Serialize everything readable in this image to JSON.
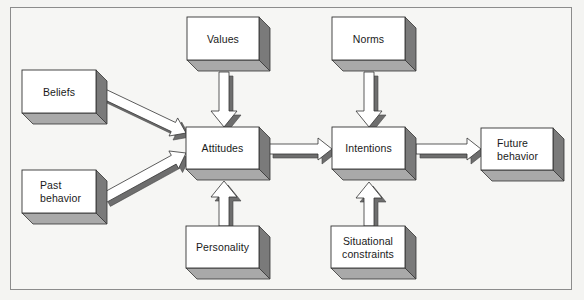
{
  "diagram": {
    "title": "",
    "nodes": [
      {
        "id": "values",
        "label": [
          "Values"
        ]
      },
      {
        "id": "norms",
        "label": [
          "Norms"
        ]
      },
      {
        "id": "beliefs",
        "label": [
          "Beliefs"
        ]
      },
      {
        "id": "attitudes",
        "label": [
          "Attitudes"
        ]
      },
      {
        "id": "intentions",
        "label": [
          "Intentions"
        ]
      },
      {
        "id": "future-behavior",
        "label": [
          "Future",
          "behavior"
        ]
      },
      {
        "id": "past-behavior",
        "label": [
          "Past",
          "behavior"
        ]
      },
      {
        "id": "personality",
        "label": [
          "Personality"
        ]
      },
      {
        "id": "situational-constraints",
        "label": [
          "Situational",
          "constraints"
        ]
      }
    ],
    "edges": [
      {
        "from": "beliefs",
        "to": "attitudes"
      },
      {
        "from": "past-behavior",
        "to": "attitudes"
      },
      {
        "from": "values",
        "to": "attitudes"
      },
      {
        "from": "personality",
        "to": "attitudes"
      },
      {
        "from": "attitudes",
        "to": "intentions"
      },
      {
        "from": "norms",
        "to": "intentions"
      },
      {
        "from": "situational-constraints",
        "to": "intentions"
      },
      {
        "from": "intentions",
        "to": "future-behavior"
      }
    ],
    "colors": {
      "face": "#ffffff",
      "side": "#7a7a7a",
      "bottom": "#a9a9a9",
      "outline": "#333333",
      "arrow_fill": "#ffffff",
      "arrow_shadow": "#6e6e6e"
    }
  }
}
